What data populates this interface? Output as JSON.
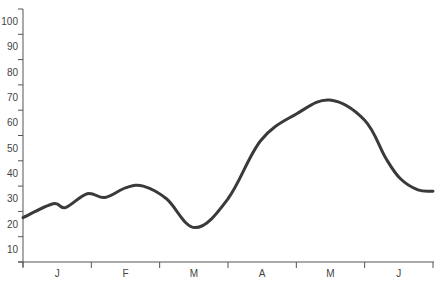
{
  "chart_data": {
    "type": "line",
    "title": "",
    "xlabel": "",
    "ylabel": "",
    "categories": [
      "J",
      "F",
      "M",
      "A",
      "M",
      "J"
    ],
    "y_ticks": [
      10,
      20,
      30,
      40,
      50,
      60,
      70,
      80,
      90,
      100
    ],
    "ylim": [
      5,
      105
    ],
    "grid": false,
    "legend": null,
    "line_color": "#3a3a3a",
    "axis_color": "#555555",
    "series": [
      {
        "name": "series-1",
        "points": [
          {
            "x": 0.0,
            "y": 22.5
          },
          {
            "x": 0.44,
            "y": 28.0
          },
          {
            "x": 0.62,
            "y": 26.5
          },
          {
            "x": 0.94,
            "y": 32.0
          },
          {
            "x": 1.2,
            "y": 30.5
          },
          {
            "x": 1.51,
            "y": 34.4
          },
          {
            "x": 1.76,
            "y": 35.0
          },
          {
            "x": 2.1,
            "y": 30.0
          },
          {
            "x": 2.52,
            "y": 18.6
          },
          {
            "x": 3.0,
            "y": 30.0
          },
          {
            "x": 3.48,
            "y": 53.0
          },
          {
            "x": 4.0,
            "y": 63.5
          },
          {
            "x": 4.49,
            "y": 69.0
          },
          {
            "x": 5.0,
            "y": 61.0
          },
          {
            "x": 5.31,
            "y": 46.0
          },
          {
            "x": 5.52,
            "y": 38.0
          },
          {
            "x": 5.78,
            "y": 33.5
          },
          {
            "x": 6.0,
            "y": 33.0
          }
        ]
      }
    ]
  }
}
